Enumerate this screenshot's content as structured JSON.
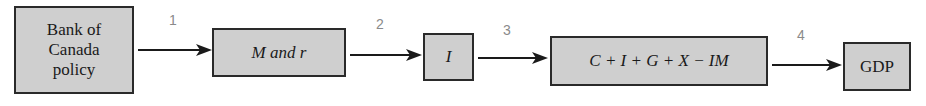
{
  "diagram": {
    "nodes": [
      {
        "id": "bank",
        "label": "Bank of\nCanada\npolicy"
      },
      {
        "id": "money",
        "label": "M and r"
      },
      {
        "id": "investment",
        "label": "I"
      },
      {
        "id": "expenditure",
        "label": "C + I + G + X − IM"
      },
      {
        "id": "gdp",
        "label": "GDP"
      }
    ],
    "steps": [
      {
        "number": "1",
        "from": "bank",
        "to": "money"
      },
      {
        "number": "2",
        "from": "money",
        "to": "investment"
      },
      {
        "number": "3",
        "from": "investment",
        "to": "expenditure"
      },
      {
        "number": "4",
        "from": "expenditure",
        "to": "gdp"
      }
    ],
    "colors": {
      "box_fill": "#cfcfcf",
      "border": "#2a2a2a",
      "step_number": "#8a8a8a"
    }
  }
}
